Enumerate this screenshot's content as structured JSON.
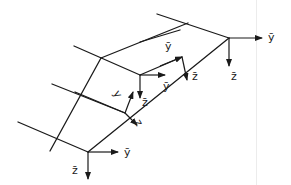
{
  "diagram": {
    "type": "skewed grid / beam structure with local coordinate triads",
    "colors": {
      "stroke": "#1a1a1a",
      "background": "#ffffff"
    },
    "grid_lines": [
      {
        "name": "beam-line-1",
        "x1": 157,
        "y1": 14,
        "x2": 229,
        "y2": 38
      },
      {
        "name": "beam-line-2",
        "x1": 74,
        "y1": 46,
        "x2": 140,
        "y2": 75
      },
      {
        "name": "beam-line-3",
        "x1": 52,
        "y1": 84,
        "x2": 125,
        "y2": 113
      },
      {
        "name": "beam-line-4",
        "x1": 18,
        "y1": 122,
        "x2": 88,
        "y2": 152
      },
      {
        "name": "girder-right",
        "x1": 88,
        "y1": 152,
        "x2": 229,
        "y2": 38
      },
      {
        "name": "girder-left",
        "x1": 50,
        "y1": 151,
        "x2": 101,
        "y2": 58
      },
      {
        "name": "cross-top",
        "x1": 101,
        "y1": 58,
        "x2": 188,
        "y2": 23
      },
      {
        "name": "cross-mid",
        "x1": 140,
        "y1": 75,
        "x2": 182,
        "y2": 57
      },
      {
        "name": "rib-1",
        "x1": 180,
        "y1": 30,
        "x2": 140,
        "y2": 42
      },
      {
        "name": "rib-2",
        "x1": 125,
        "y1": 113,
        "x2": 75,
        "y2": 92
      }
    ],
    "triads": [
      {
        "name": "triad-top-right",
        "origin": [
          229,
          38
        ],
        "axes": [
          {
            "label": "ȳ",
            "to": [
              262,
              38
            ],
            "label_pos": [
              268,
              41
            ]
          },
          {
            "label": "z̄",
            "to": [
              229,
              66
            ],
            "label_pos": [
              231,
              80
            ]
          }
        ]
      },
      {
        "name": "triad-upper-mid",
        "origin": [
          182,
          57
        ],
        "axes": [
          {
            "label": "ȳ",
            "from": [
              160,
              66
            ],
            "to": [
              182,
              57
            ],
            "label_pos": [
              165,
              50
            ]
          },
          {
            "label": "z̄",
            "to": [
              187,
              80
            ],
            "label_pos": [
              192,
              80
            ]
          }
        ]
      },
      {
        "name": "triad-middle",
        "origin": [
          140,
          75
        ],
        "axes": [
          {
            "label": "ȳ",
            "to": [
              165,
              75
            ],
            "label_pos": [
              163,
              90
            ]
          },
          {
            "label": "z̄",
            "to": [
              140,
              98
            ],
            "label_pos": [
              142,
              106
            ]
          }
        ]
      },
      {
        "name": "triad-lower-mid",
        "origin": [
          125,
          113
        ],
        "axes": [
          {
            "label": "y",
            "from": [
              125,
              113
            ],
            "to": [
              133,
              92
            ],
            "label_pos": [
              113,
              93
            ],
            "rotated": true
          },
          {
            "label": "z",
            "to": [
              137,
              125
            ],
            "label_pos": [
              134,
              122
            ],
            "rotated": true
          }
        ]
      },
      {
        "name": "triad-bottom",
        "origin": [
          88,
          152
        ],
        "axes": [
          {
            "label": "ȳ",
            "to": [
              118,
              152
            ],
            "label_pos": [
              124,
              156
            ]
          },
          {
            "label": "z̄",
            "to": [
              88,
              179
            ],
            "label_pos": [
              72,
              174
            ]
          }
        ]
      }
    ]
  }
}
